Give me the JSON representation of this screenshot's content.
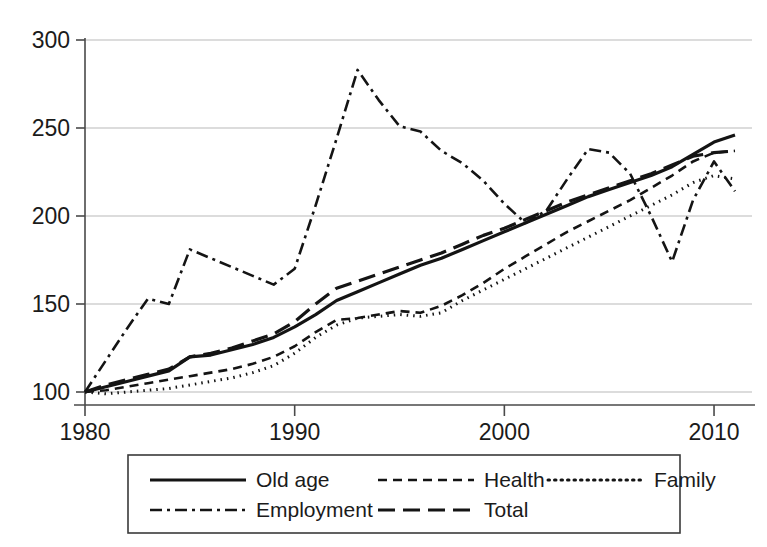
{
  "chart_data": {
    "type": "line",
    "title": "",
    "subtitle": "",
    "xlabel": "",
    "ylabel": "",
    "xlim": [
      1980,
      2011
    ],
    "ylim": [
      96,
      305
    ],
    "grid": true,
    "grid_axis": "y",
    "legend_position": "bottom",
    "legend_columns": 3,
    "yticks": [
      100,
      150,
      200,
      250,
      300
    ],
    "ytick_labels": [
      "100",
      "150",
      "200",
      "250",
      "300"
    ],
    "xticks": [
      1980,
      1990,
      2000,
      2010
    ],
    "xtick_labels": [
      "1980",
      "1990",
      "2000",
      "2010"
    ],
    "x": [
      1980,
      1981,
      1982,
      1983,
      1984,
      1985,
      1986,
      1987,
      1988,
      1989,
      1990,
      1991,
      1992,
      1993,
      1994,
      1995,
      1996,
      1997,
      1998,
      1999,
      2000,
      2001,
      2002,
      2003,
      2004,
      2005,
      2006,
      2007,
      2008,
      2009,
      2010,
      2011
    ],
    "series": [
      {
        "name": "Old age",
        "style": "solid",
        "dash": "none",
        "width": 3.2,
        "color": "#141414",
        "values": [
          100,
          103,
          106,
          109,
          112,
          120,
          121,
          124,
          127,
          131,
          137,
          144,
          152,
          157,
          162,
          167,
          172,
          176,
          181,
          186,
          191,
          196,
          201,
          206,
          211,
          215,
          219,
          223,
          228,
          235,
          242,
          246
        ]
      },
      {
        "name": "Health",
        "style": "dashed",
        "dash": "9,6",
        "width": 2.6,
        "color": "#141414",
        "values": [
          100,
          101,
          103,
          105,
          107,
          109,
          111,
          113,
          116,
          120,
          126,
          134,
          141,
          142,
          144,
          146,
          145,
          149,
          155,
          162,
          170,
          177,
          184,
          191,
          197,
          203,
          209,
          216,
          223,
          231,
          236,
          237
        ]
      },
      {
        "name": "Family",
        "style": "dotted",
        "dash": "1.5,5",
        "width": 3.0,
        "color": "#141414",
        "values": [
          100,
          99,
          100,
          101,
          102,
          104,
          106,
          108,
          111,
          115,
          122,
          131,
          138,
          142,
          143,
          144,
          143,
          145,
          152,
          158,
          164,
          170,
          176,
          182,
          188,
          194,
          200,
          206,
          212,
          219,
          223,
          221
        ]
      },
      {
        "name": "Employment",
        "style": "dash-dot",
        "dash": "12,5,3,5",
        "width": 2.6,
        "color": "#141414",
        "values": [
          100,
          118,
          136,
          153,
          150,
          181,
          176,
          171,
          166,
          161,
          170,
          206,
          244,
          283,
          266,
          251,
          248,
          237,
          230,
          220,
          207,
          196,
          203,
          221,
          238,
          236,
          224,
          200,
          174,
          209,
          231,
          214
        ]
      },
      {
        "name": "Total",
        "style": "long-dash",
        "dash": "17,8",
        "width": 3.2,
        "color": "#141414",
        "values": [
          100,
          104,
          107,
          110,
          113,
          120,
          122,
          125,
          129,
          133,
          140,
          150,
          159,
          163,
          167,
          171,
          175,
          179,
          184,
          189,
          193,
          198,
          203,
          208,
          212,
          216,
          220,
          224,
          229,
          234,
          236,
          237
        ]
      }
    ]
  },
  "legend": {
    "entries": [
      {
        "label": "Old age",
        "style": "solid"
      },
      {
        "label": "Health",
        "style": "dashed"
      },
      {
        "label": "Family",
        "style": "dotted"
      },
      {
        "label": "Employment",
        "style": "dash-dot"
      },
      {
        "label": "Total",
        "style": "long-dash"
      }
    ]
  }
}
